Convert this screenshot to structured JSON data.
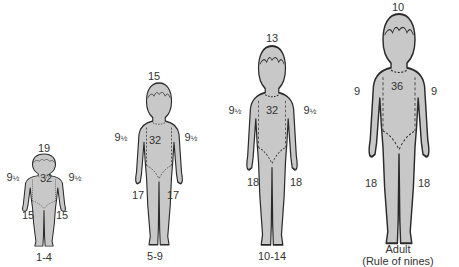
{
  "colors": {
    "figure_fill": "#c8c8c8",
    "outline": "#2a2a2a",
    "text": "#333333",
    "background": "#ffffff"
  },
  "figures": [
    {
      "id": "age-1-4",
      "caption": "1-4",
      "head": "19",
      "arm_left": "9",
      "arm_left_frac": "½",
      "arm_right": "9",
      "arm_right_frac": "½",
      "trunk": "32",
      "leg_left": "15",
      "leg_right": "15"
    },
    {
      "id": "age-5-9",
      "caption": "5-9",
      "head": "15",
      "arm_left": "9",
      "arm_left_frac": "½",
      "arm_right": "9",
      "arm_right_frac": "½",
      "trunk": "32",
      "leg_left": "17",
      "leg_right": "17"
    },
    {
      "id": "age-10-14",
      "caption": "10-14",
      "head": "13",
      "arm_left": "9",
      "arm_left_frac": "½",
      "arm_right": "9",
      "arm_right_frac": "½",
      "trunk": "32",
      "leg_left": "18",
      "leg_right": "18"
    },
    {
      "id": "adult",
      "caption": "Adult",
      "caption_line2": "(Rule of nines)",
      "head": "10",
      "arm_left": "9",
      "arm_right": "9",
      "trunk": "36",
      "leg_left": "18",
      "leg_right": "18"
    }
  ]
}
